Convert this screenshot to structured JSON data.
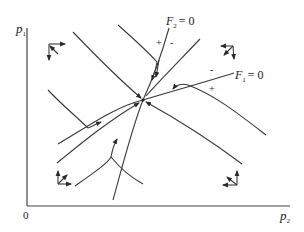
{
  "diagram": {
    "type": "phase-diagram",
    "axes": {
      "y_label": "p",
      "y_label_sub": "1",
      "x_label": "p",
      "x_label_sub": "2",
      "origin_label": "0"
    },
    "curves": {
      "f2": {
        "name": "F",
        "sub": "2",
        "eq": "= 0",
        "plus": "+",
        "minus": "-"
      },
      "f1": {
        "name": "F",
        "sub": "1",
        "eq": "= 0",
        "plus": "+",
        "minus": "-"
      }
    },
    "equilibrium": {
      "x": 143,
      "y": 100
    },
    "region_arrows": [
      {
        "region": "top-left",
        "directions": [
          "right",
          "down",
          "up-left"
        ]
      },
      {
        "region": "top-right",
        "directions": [
          "left",
          "down",
          "down-left"
        ]
      },
      {
        "region": "bottom-left",
        "directions": [
          "up",
          "right",
          "up-right"
        ]
      },
      {
        "region": "bottom-right",
        "directions": [
          "up",
          "left",
          "up-left"
        ]
      }
    ],
    "colors": {
      "line": "#3a3a3a",
      "background": "#ffffff"
    }
  }
}
